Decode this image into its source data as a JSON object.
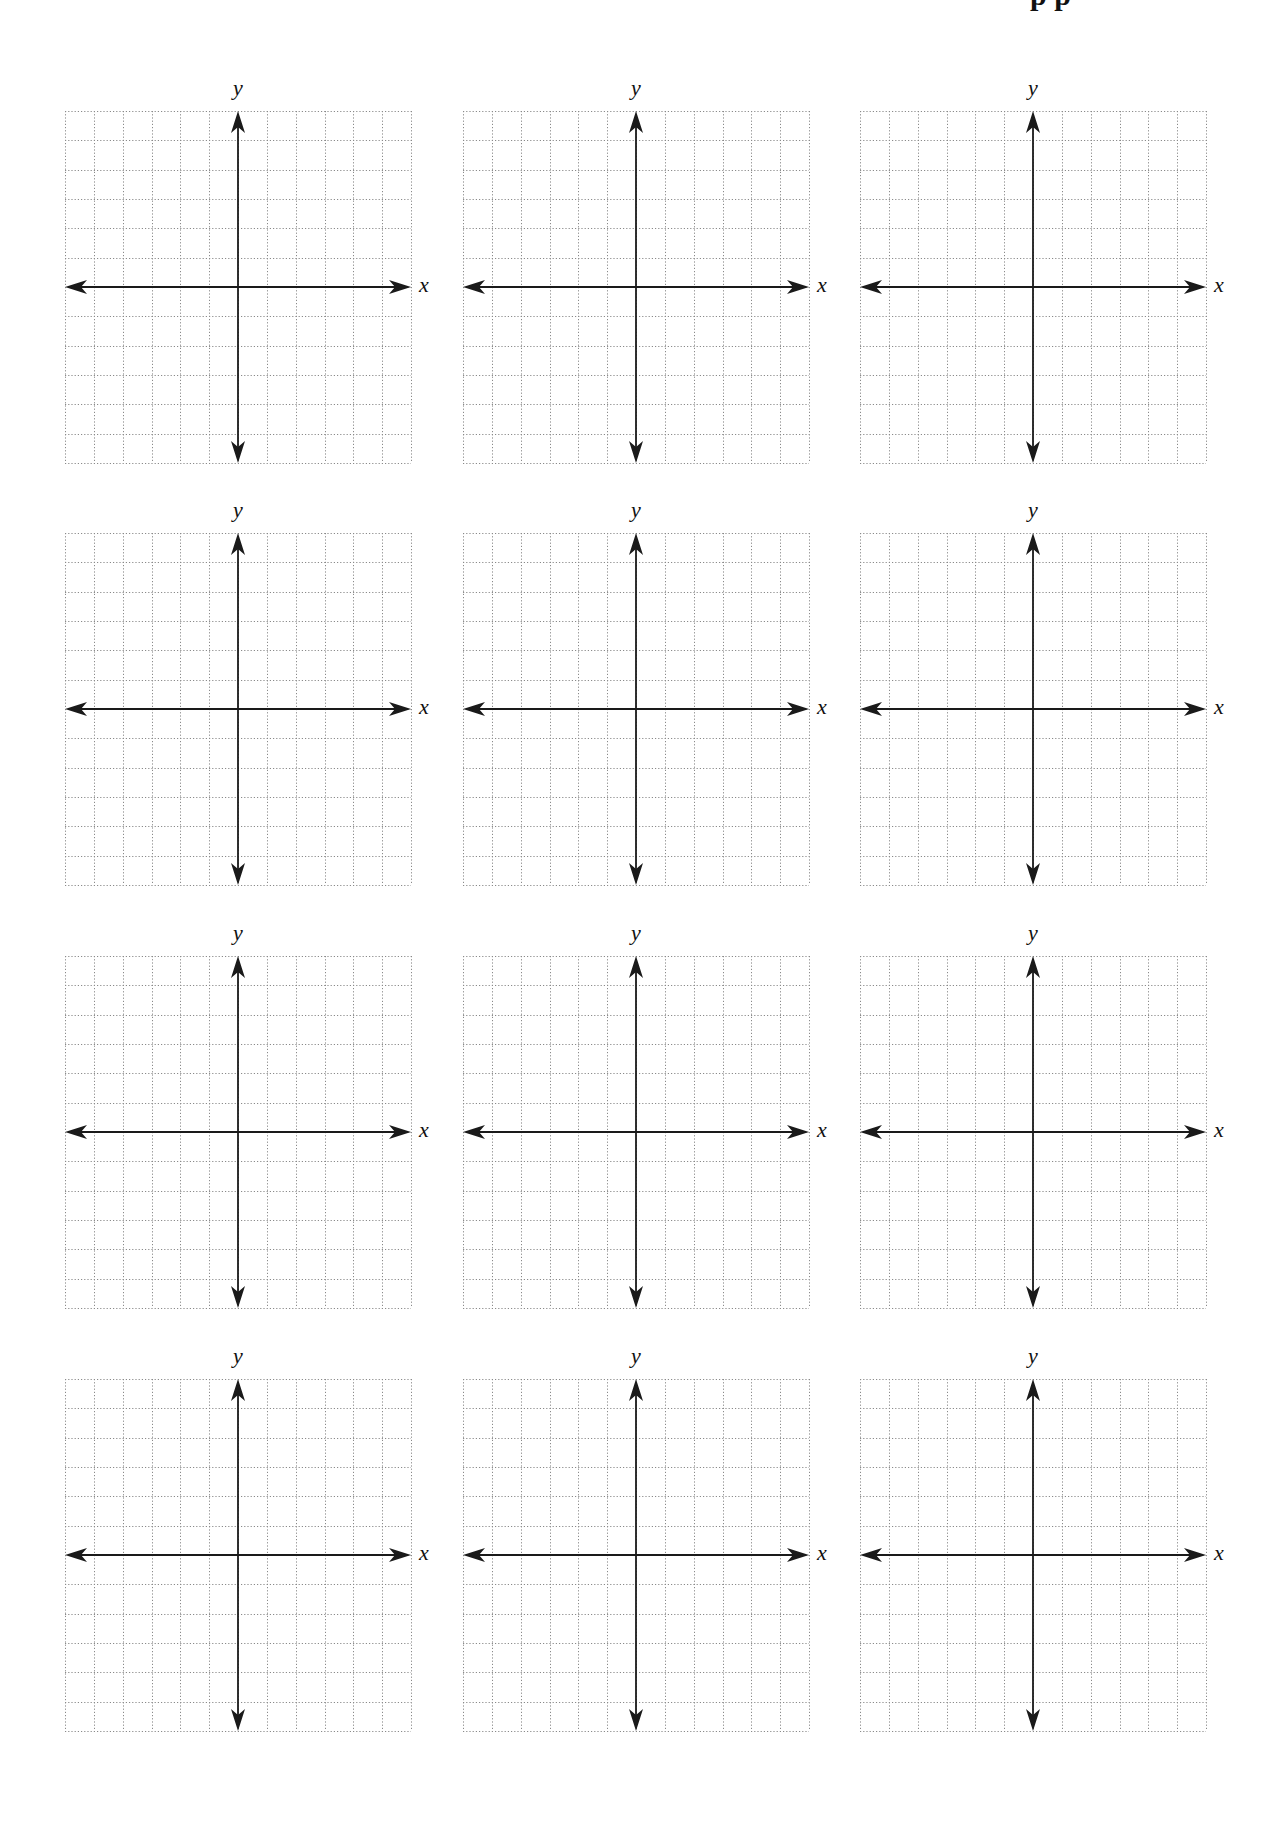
{
  "page": {
    "title_fragment": "p p",
    "grid_style": {
      "cells_x": 12,
      "cells_y": 12,
      "grid_color": "#8a8a8a",
      "axis_color": "#1a1a1a",
      "background": "#ffffff"
    },
    "layout": {
      "columns_left": [
        65,
        463,
        860
      ],
      "rows_top": [
        111,
        533,
        956,
        1379
      ],
      "graph_width": 346,
      "graph_height": 352
    }
  },
  "graphs": [
    {
      "id": 1,
      "row": 1,
      "col": 1,
      "x_label": "x",
      "y_label": "y"
    },
    {
      "id": 2,
      "row": 1,
      "col": 2,
      "x_label": "x",
      "y_label": "y"
    },
    {
      "id": 3,
      "row": 1,
      "col": 3,
      "x_label": "x",
      "y_label": "y"
    },
    {
      "id": 4,
      "row": 2,
      "col": 1,
      "x_label": "x",
      "y_label": "y"
    },
    {
      "id": 5,
      "row": 2,
      "col": 2,
      "x_label": "x",
      "y_label": "y"
    },
    {
      "id": 6,
      "row": 2,
      "col": 3,
      "x_label": "x",
      "y_label": "y"
    },
    {
      "id": 7,
      "row": 3,
      "col": 1,
      "x_label": "x",
      "y_label": "y"
    },
    {
      "id": 8,
      "row": 3,
      "col": 2,
      "x_label": "x",
      "y_label": "y"
    },
    {
      "id": 9,
      "row": 3,
      "col": 3,
      "x_label": "x",
      "y_label": "y"
    },
    {
      "id": 10,
      "row": 4,
      "col": 1,
      "x_label": "x",
      "y_label": "y"
    },
    {
      "id": 11,
      "row": 4,
      "col": 2,
      "x_label": "x",
      "y_label": "y"
    },
    {
      "id": 12,
      "row": 4,
      "col": 3,
      "x_label": "x",
      "y_label": "y"
    }
  ]
}
